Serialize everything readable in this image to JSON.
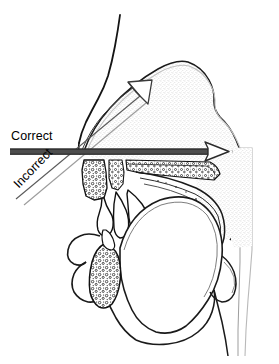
{
  "figure": {
    "type": "anatomical-line-diagram",
    "width": 279,
    "height": 364,
    "background_color": "#ffffff",
    "line_color": "#000000",
    "stipple_color": "#9a9a9a"
  },
  "labels": {
    "correct": "Correct",
    "incorrect": "Incorrect"
  },
  "annotations": [
    {
      "id": "correct-arrow",
      "label": "Correct",
      "style": "solid-bar-with-open-head",
      "direction": "horizontal-right",
      "start": [
        10,
        152
      ],
      "end": [
        228,
        152
      ],
      "meaning": "airflow through the oral cavity"
    },
    {
      "id": "incorrect-arrow",
      "label": "Incorrect",
      "style": "open-outline-arrow",
      "direction": "diagonal-up-right",
      "start": [
        18,
        196
      ],
      "end": [
        152,
        84
      ],
      "meaning": "airflow through the nasal cavity"
    }
  ],
  "anatomy_parts": [
    "forehead-and-nose-profile",
    "nasal-cavity",
    "stippled-skull-region",
    "hard-palate",
    "upper-teeth-alveolar-ridge",
    "soft-palate",
    "uvula",
    "tongue",
    "lips",
    "mandible",
    "pharyngeal-wall",
    "epiglottis",
    "chin-and-neck-profile"
  ]
}
